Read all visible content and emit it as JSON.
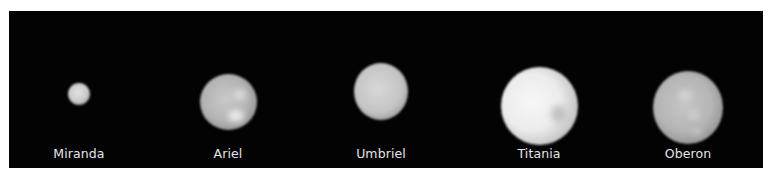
{
  "figure": {
    "background": "#030303",
    "label_color": "#e6e6e6",
    "moons": [
      {
        "name": "Miranda",
        "cx": 70,
        "cy": 83,
        "r": 11,
        "base": "#cfcfcf",
        "edge": "#6a6a6a"
      },
      {
        "name": "Ariel",
        "cx": 219,
        "cy": 91,
        "r": 28,
        "base": "#bdbdbd",
        "edge": "#5a5a5a"
      },
      {
        "name": "Umbriel",
        "cx": 372,
        "cy": 80,
        "r": 27,
        "base": "#c8c8c8",
        "edge": "#5e5e5e"
      },
      {
        "name": "Titania",
        "cx": 531,
        "cy": 95,
        "r": 38,
        "base": "#e8e8e8",
        "edge": "#6a6a6a"
      },
      {
        "name": "Oberon",
        "cx": 679,
        "cy": 96,
        "r": 35,
        "base": "#bcbcbc",
        "edge": "#575757"
      }
    ]
  },
  "labels": {
    "miranda": "Miranda",
    "ariel": "Ariel",
    "umbriel": "Umbriel",
    "titania": "Titania",
    "oberon": "Oberon"
  }
}
